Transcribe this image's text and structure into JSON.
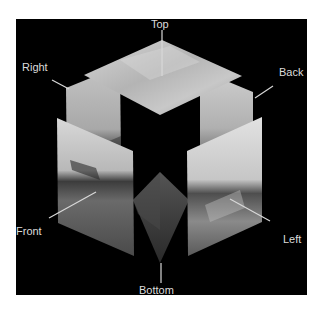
{
  "figure": {
    "background_color": "#000000",
    "label_color": "#dcdcdc",
    "leader_color": "#d8d8d8",
    "faces": [
      {
        "id": "top",
        "label": "Top",
        "content": "cloudy sky"
      },
      {
        "id": "right",
        "label": "Right",
        "content": "sky and horizon"
      },
      {
        "id": "back",
        "label": "Back",
        "content": "sky and horizon"
      },
      {
        "id": "front",
        "label": "Front",
        "content": "beach with trees and buildings"
      },
      {
        "id": "left",
        "label": "Left",
        "content": "beach with water and people"
      },
      {
        "id": "bottom",
        "label": "Bottom",
        "content": "sand / ground"
      }
    ]
  }
}
